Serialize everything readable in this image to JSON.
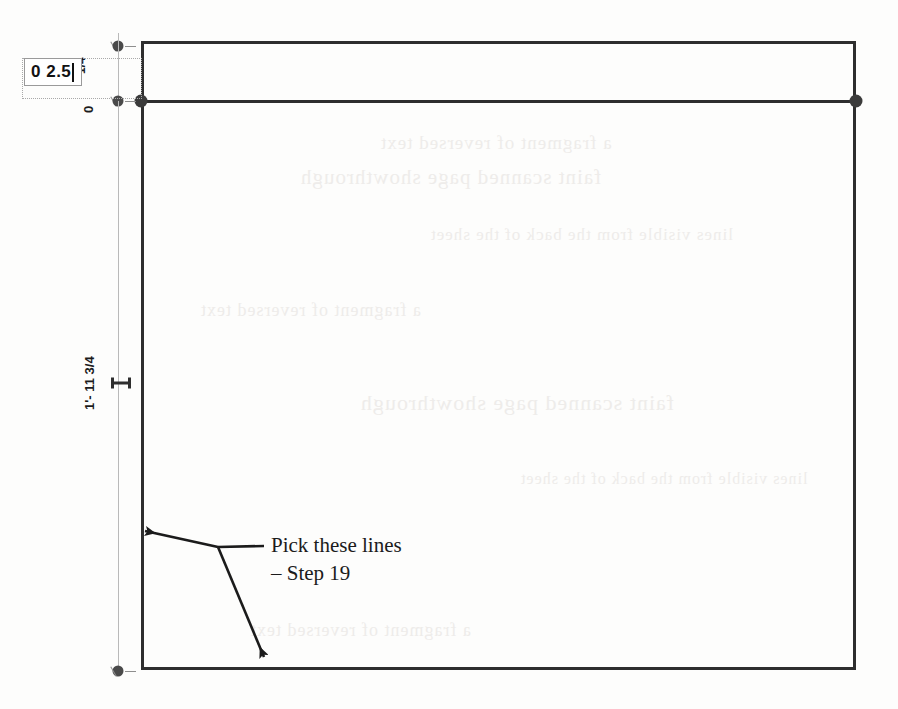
{
  "page": {
    "width": 898,
    "height": 709,
    "background": "#fdfdfc",
    "kind": "scanned-cad-tutorial-figure"
  },
  "colors": {
    "geometry": "#2e2e2e",
    "grip": "#3b3b3b",
    "dimension_line": "#b9b9b9",
    "dimension_text": "#1c1c1c",
    "annotation": "#1b1b1b",
    "edit_box_border": "#9a9a9a",
    "edit_bbox_border": "#a9a9a9",
    "caret": "#111111"
  },
  "edit_field": {
    "value": "0 2.5",
    "placeholder": "",
    "caret_visible": true
  },
  "dimensions": [
    {
      "id": "top",
      "label": "1/4",
      "orientation": "vertical-rotated"
    },
    {
      "id": "overall",
      "label": "1'- 11 3/4",
      "orientation": "vertical-rotated"
    },
    {
      "id": "zero",
      "label": "0",
      "orientation": "vertical-rotated"
    }
  ],
  "annotation": {
    "line1": "Pick these lines",
    "line2": "– Step 19",
    "leader_count": 2
  },
  "geometry": {
    "outer_rect": {
      "x": 141,
      "y": 41,
      "w": 715,
      "h": 629
    },
    "inner_top_line_y": 101,
    "grips": [
      {
        "x": 141,
        "y": 101
      },
      {
        "x": 856,
        "y": 101
      }
    ]
  },
  "bleed_through": [
    "a fragment of reversed text",
    "faint scanned page showthrough",
    "lines visible from the back of the sheet"
  ]
}
